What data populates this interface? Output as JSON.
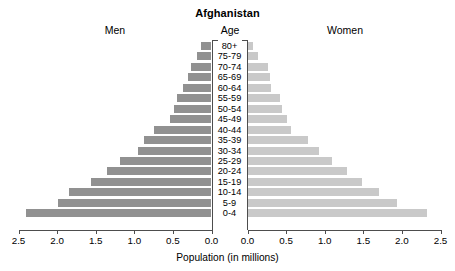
{
  "chart_data": {
    "type": "bar",
    "subtype": "population-pyramid",
    "title": "Afghanistan",
    "xlabel": "Population (in millions)",
    "ylabel": "Age",
    "left_header": "Men",
    "center_header": "Age",
    "right_header": "Women",
    "grid": false,
    "legend": "none",
    "xlim_left": [
      2.5,
      0.0
    ],
    "xlim_right": [
      0.0,
      2.5
    ],
    "tick_values_left": [
      "2.5",
      "2.0",
      "1.5",
      "1.0",
      "0.5",
      "0.0"
    ],
    "tick_values_right": [
      "0.0",
      "0.5",
      "1.0",
      "1.5",
      "2.0",
      "2.5"
    ],
    "tick_numbers_left": [
      2.5,
      2.0,
      1.5,
      1.0,
      0.5,
      0.0
    ],
    "tick_numbers_right": [
      0.0,
      0.5,
      1.0,
      1.5,
      2.0,
      2.5
    ],
    "categories": [
      "80+",
      "75-79",
      "70-74",
      "65-69",
      "60-64",
      "55-59",
      "50-54",
      "45-49",
      "40-44",
      "35-39",
      "30-34",
      "25-29",
      "20-24",
      "15-19",
      "10-14",
      "5-9",
      "0-4"
    ],
    "series": [
      {
        "name": "Men",
        "color": "#919191",
        "side": "left",
        "values": [
          0.13,
          0.19,
          0.26,
          0.31,
          0.37,
          0.45,
          0.49,
          0.54,
          0.74,
          0.87,
          0.95,
          1.19,
          1.36,
          1.56,
          1.85,
          1.99,
          2.4
        ]
      },
      {
        "name": "Women",
        "color": "#c9c9c9",
        "side": "right",
        "values": [
          0.07,
          0.14,
          0.27,
          0.29,
          0.3,
          0.42,
          0.45,
          0.51,
          0.56,
          0.79,
          0.92,
          1.1,
          1.29,
          1.48,
          1.7,
          1.94,
          2.33
        ]
      }
    ]
  },
  "colors": {
    "male_bar": "#919191",
    "female_bar": "#c9c9c9",
    "axis": "#4d4d4d",
    "text": "#000000",
    "background": "#ffffff"
  }
}
